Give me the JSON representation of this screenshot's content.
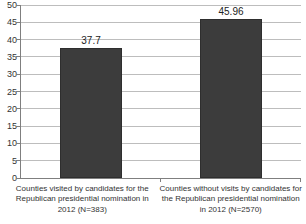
{
  "chart_data": {
    "type": "bar",
    "categories": [
      "Counties visited by candidates for the Republican presidential nomination in 2012 (N=383)",
      "Counties without visits by candidates for the Republican presidential nomination in 2012 (N=2570)"
    ],
    "values": [
      37.7,
      45.96
    ],
    "value_labels": [
      "37.7",
      "45.96"
    ],
    "title": "",
    "xlabel": "",
    "ylabel": "",
    "ylim": [
      0,
      50
    ],
    "y_ticks": [
      0,
      5,
      10,
      15,
      20,
      25,
      30,
      35,
      40,
      45,
      50
    ],
    "y_tick_labels": [
      "0",
      "5",
      "10",
      "15",
      "20",
      "25",
      "30",
      "35",
      "40",
      "45",
      "50"
    ],
    "grid": "horizontal",
    "legend": "none",
    "bar_color": "#3c3c3c",
    "gridline_color": "#bdbdbd",
    "axis_color": "#7f7f7f",
    "text_color": "#333333",
    "background": "#ffffff"
  }
}
